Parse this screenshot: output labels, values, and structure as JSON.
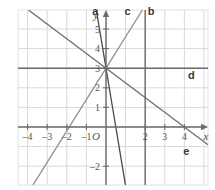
{
  "figure": {
    "background_color": "#ffffff",
    "grid_color": "#d9d9d9",
    "axis_color": "#6b6b6b",
    "plot_border_color": "#e2e2e2"
  },
  "axes": {
    "x_label": "x",
    "y_label": "y",
    "origin_label": "O",
    "x_ticks": [
      {
        "value": -4,
        "label": "–4"
      },
      {
        "value": -3,
        "label": "–3"
      },
      {
        "value": -2,
        "label": "–2"
      },
      {
        "value": -1,
        "label": "–1"
      },
      {
        "value": 2,
        "label": "2"
      },
      {
        "value": 3,
        "label": "3"
      },
      {
        "value": 4,
        "label": "4"
      }
    ],
    "y_ticks": [
      {
        "value": 5,
        "label": "5"
      },
      {
        "value": 4,
        "label": "4"
      },
      {
        "value": 3,
        "label": "3"
      },
      {
        "value": 2,
        "label": "2"
      },
      {
        "value": 1,
        "label": "1"
      },
      {
        "value": -2,
        "label": "–2"
      }
    ],
    "xlim": [
      -4.5,
      5.2
    ],
    "ylim": [
      -2.9,
      6.0
    ],
    "grid": true
  },
  "chart_data": {
    "type": "line",
    "xlabel": "x",
    "ylabel": "y",
    "xlim": [
      -4.5,
      5.2
    ],
    "ylim": [
      -2.9,
      6.0
    ],
    "grid": true,
    "legend": "inline-end-labels",
    "common_point": {
      "x": 0,
      "y": 3
    },
    "series": [
      {
        "name": "a",
        "label": "a",
        "kind": "line",
        "slope": -6,
        "intercept": 3,
        "color": "#4a4a4a",
        "label_position": {
          "x": -0.55,
          "y": 5.7
        }
      },
      {
        "name": "b",
        "label": "b",
        "kind": "vertical",
        "x_value": 2,
        "color": "#6b6b6b",
        "label_position": {
          "x": 2.3,
          "y": 5.7
        }
      },
      {
        "name": "c",
        "label": "c",
        "kind": "line",
        "slope": 1.6,
        "intercept": 3,
        "color": "#8d8d8d",
        "label_position": {
          "x": 1.1,
          "y": 5.7
        }
      },
      {
        "name": "d",
        "label": "d",
        "kind": "horizontal",
        "y_value": 3,
        "color": "#6b6b6b",
        "label_position": {
          "x": 4.35,
          "y": 2.45
        }
      },
      {
        "name": "e",
        "label": "e",
        "kind": "line",
        "slope": -0.75,
        "intercept": 3,
        "color": "#6b6b6b",
        "label_position": {
          "x": 4.1,
          "y": -1.45
        }
      }
    ]
  }
}
